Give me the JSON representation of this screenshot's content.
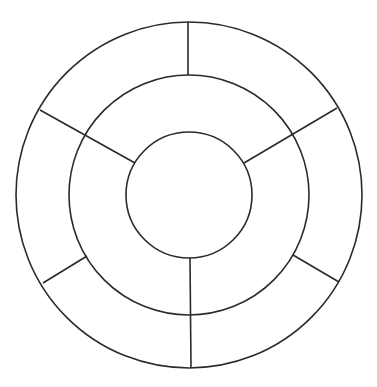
{
  "diagram": {
    "type": "concentric-ring-wheel",
    "background": "#ffffff",
    "stroke_color": "#2a2a2a",
    "stroke_width": 1.6,
    "center": {
      "x": 189,
      "y": 195
    },
    "rings": [
      {
        "name": "inner-circle",
        "radius": 63,
        "segments": 1
      },
      {
        "name": "middle-ring",
        "radius": 120,
        "segments": 3,
        "divider_angles_deg": [
          150,
          30,
          270
        ]
      },
      {
        "name": "outer-ring",
        "radius": 173,
        "segments": 6,
        "divider_angles_deg": [
          90,
          30,
          330,
          270,
          210,
          150
        ]
      }
    ],
    "spokes": [
      {
        "name": "spoke-top-outer",
        "x1": 188,
        "y1": 22,
        "x2": 188,
        "y2": 75
      },
      {
        "name": "spoke-upper-right",
        "x1": 337,
        "y1": 108,
        "x2": 244,
        "y2": 163
      },
      {
        "name": "spoke-lower-right-outer",
        "x1": 293,
        "y1": 255,
        "x2": 339,
        "y2": 282
      },
      {
        "name": "spoke-bottom",
        "x1": 190,
        "y1": 258,
        "x2": 191,
        "y2": 368
      },
      {
        "name": "spoke-lower-left-outer",
        "x1": 87,
        "y1": 256,
        "x2": 43,
        "y2": 283
      },
      {
        "name": "spoke-upper-left",
        "x1": 40,
        "y1": 110,
        "x2": 135,
        "y2": 163
      }
    ]
  }
}
